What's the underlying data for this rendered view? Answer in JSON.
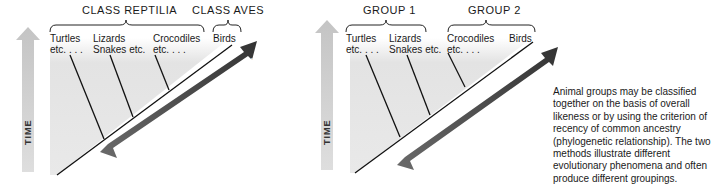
{
  "left_diagram": {
    "groups": [
      {
        "label": "CLASS REPTILIA"
      },
      {
        "label": "CLASS AVES"
      }
    ],
    "taxa": [
      {
        "line1": "Turtles",
        "line2": "etc. . . ."
      },
      {
        "line1": "Lizards",
        "line2": "Snakes etc."
      },
      {
        "line1": "Crocodiles",
        "line2": "etc. . . ."
      },
      {
        "line1": "Birds",
        "line2": ""
      }
    ],
    "time_label": "TIME",
    "divergence_label": "MORPHOLOGICAL DIVERGENCE"
  },
  "right_diagram": {
    "groups": [
      {
        "label": "GROUP 1"
      },
      {
        "label": "GROUP 2"
      }
    ],
    "taxa": [
      {
        "line1": "Turtles",
        "line2": "etc. . . ."
      },
      {
        "line1": "Lizards",
        "line2": "Snakes etc."
      },
      {
        "line1": "Crocodiles",
        "line2": "etc. . . ."
      },
      {
        "line1": "Birds",
        "line2": ""
      }
    ],
    "time_label": "TIME",
    "divergence_label": "MORPHOLOGICAL DIVERGENCE"
  },
  "caption": "Animal groups may be classified together on the basis of overall likeness or by using the criterion of recency of common ancestry (phylogenetic relationship). The two methods illustrate different evolutionary phenomena and often produce different groupings.",
  "colors": {
    "time_arrow": "#c8c8c8",
    "divergence_arrow": "#4a4a4a",
    "shade": "#e4e4e4",
    "line": "#111111"
  }
}
